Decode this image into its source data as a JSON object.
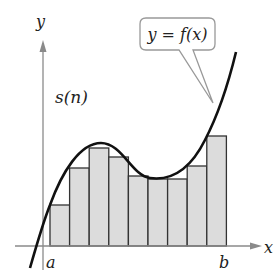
{
  "diagram": {
    "labels": {
      "y_axis": "y",
      "x_axis": "x",
      "sum_label": "s(n)",
      "left_bound": "a",
      "right_bound": "b",
      "callout": "y = f(x)"
    },
    "colors": {
      "axis": "#8a8a8a",
      "curve": "#111111",
      "rect_fill": "#dcdcdc",
      "rect_stroke": "#333333",
      "callout_stroke": "#999999"
    },
    "rectangles": {
      "count": 9,
      "x_start": 50,
      "width": 19.6,
      "baseline_y": 246,
      "tops_y": [
        205,
        168,
        148,
        157,
        176,
        179,
        179,
        166,
        136
      ]
    }
  }
}
